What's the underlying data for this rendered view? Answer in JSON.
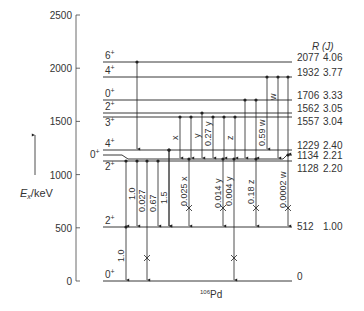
{
  "diagram": {
    "nucleus": "Pd",
    "mass_number": "106",
    "y_axis": {
      "label_main": "E",
      "label_sub": "x",
      "label_unit": "/keV",
      "ticks": [
        "0",
        "500",
        "1000",
        "1500",
        "2000",
        "2500"
      ],
      "tick_values": [
        0,
        500,
        1000,
        1500,
        2000,
        2500
      ]
    },
    "ratio_header": "R (J)",
    "levels": [
      {
        "spin": "6",
        "parity": "+",
        "energy": "2077",
        "ratio": "4.06",
        "y": 62
      },
      {
        "spin": "4",
        "parity": "+",
        "energy": "1932",
        "ratio": "3.77",
        "y": 77
      },
      {
        "spin": "0",
        "parity": "+",
        "energy": "1706",
        "ratio": "3.33",
        "y": 100
      },
      {
        "spin": "2",
        "parity": "+",
        "energy": "1562",
        "ratio": "3.05",
        "y": 113
      },
      {
        "spin": "3",
        "parity": "+",
        "energy": "1557",
        "ratio": "3.04",
        "y": 117
      },
      {
        "spin": "4",
        "parity": "+",
        "energy": "1229",
        "ratio": "2.40",
        "y": 150
      },
      {
        "spin": "0",
        "parity": "+",
        "energy": "1134",
        "ratio": "2.21",
        "y": 155
      },
      {
        "spin": "2",
        "parity": "+",
        "energy": "1128",
        "ratio": "2.20",
        "y": 161
      },
      {
        "spin": "2",
        "parity": "+",
        "energy": "512",
        "ratio": "1.00",
        "y": 227
      },
      {
        "spin": "0",
        "parity": "+",
        "energy": "0",
        "ratio": "",
        "y": 281
      }
    ],
    "transitions_upper": [
      {
        "label": "x",
        "from": "1557",
        "to": "1134"
      },
      {
        "label": "y",
        "from": "1557",
        "to": "1134"
      },
      {
        "label": "0.27 y",
        "from": "1562",
        "to": "1134"
      },
      {
        "label": "z",
        "from": "1706",
        "to": "1134"
      },
      {
        "label": "0.59 w",
        "from": "1932",
        "to": "1229"
      },
      {
        "label": "w",
        "from": "1932",
        "to": "1706"
      }
    ],
    "transitions_lower": [
      {
        "label": "1.0",
        "from": "1128",
        "to": "512"
      },
      {
        "label": "0.027",
        "from": "1128",
        "to": "0"
      },
      {
        "label": "0.67",
        "from": "1128",
        "to": "512"
      },
      {
        "label": "1.5",
        "from": "1229",
        "to": "512"
      },
      {
        "label": "0.025 x",
        "from": "1134",
        "to": "512"
      },
      {
        "label": "0.014 y",
        "from": "1134",
        "to": "512"
      },
      {
        "label": "0.004 y",
        "from": "1134",
        "to": "0"
      },
      {
        "label": "0.18 z",
        "from": "1134",
        "to": "512"
      },
      {
        "label": "0.0002 w",
        "from": "1134",
        "to": "512"
      }
    ],
    "transition_ground": {
      "label": "1.0",
      "from": "512",
      "to": "0"
    }
  }
}
